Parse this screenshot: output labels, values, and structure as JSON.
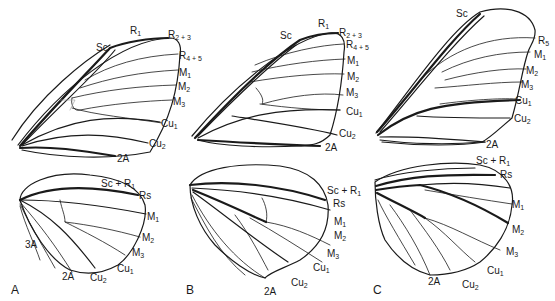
{
  "figure": {
    "panels": [
      {
        "id": "A",
        "letter": "A",
        "forewing_labels": [
          {
            "base": "Sc",
            "sub": ""
          },
          {
            "base": "R",
            "sub": "1"
          },
          {
            "base": "R",
            "sub": "2 + 3"
          },
          {
            "base": "R",
            "sub": "4 + 5"
          },
          {
            "base": "M",
            "sub": "1"
          },
          {
            "base": "M",
            "sub": "2"
          },
          {
            "base": "M",
            "sub": "3"
          },
          {
            "base": "Cu",
            "sub": "1"
          },
          {
            "base": "Cu",
            "sub": "2"
          },
          {
            "base": "2A",
            "sub": ""
          }
        ],
        "hindwing_labels": [
          {
            "base": "Sc + R",
            "sub": "1"
          },
          {
            "base": "Rs",
            "sub": ""
          },
          {
            "base": "M",
            "sub": "1"
          },
          {
            "base": "M",
            "sub": "2"
          },
          {
            "base": "M",
            "sub": "3"
          },
          {
            "base": "Cu",
            "sub": "1"
          },
          {
            "base": "Cu",
            "sub": "2"
          },
          {
            "base": "2A",
            "sub": ""
          },
          {
            "base": "3A",
            "sub": ""
          }
        ]
      },
      {
        "id": "B",
        "letter": "B",
        "forewing_labels": [
          {
            "base": "Sc",
            "sub": ""
          },
          {
            "base": "R",
            "sub": "1"
          },
          {
            "base": "R",
            "sub": "2 + 3"
          },
          {
            "base": "R",
            "sub": "4 + 5"
          },
          {
            "base": "M",
            "sub": "1"
          },
          {
            "base": "M",
            "sub": "2"
          },
          {
            "base": "M",
            "sub": "3"
          },
          {
            "base": "Cu",
            "sub": "1"
          },
          {
            "base": "Cu",
            "sub": "2"
          },
          {
            "base": "2A",
            "sub": ""
          }
        ],
        "hindwing_labels": [
          {
            "base": "Sc + R",
            "sub": "1"
          },
          {
            "base": "Rs",
            "sub": ""
          },
          {
            "base": "M",
            "sub": "1"
          },
          {
            "base": "M",
            "sub": "2"
          },
          {
            "base": "M",
            "sub": "3"
          },
          {
            "base": "Cu",
            "sub": "1"
          },
          {
            "base": "Cu",
            "sub": "2"
          },
          {
            "base": "2A",
            "sub": ""
          }
        ]
      },
      {
        "id": "C",
        "letter": "C",
        "forewing_labels": [
          {
            "base": "Sc",
            "sub": ""
          },
          {
            "base": "R",
            "sub": "5"
          },
          {
            "base": "M",
            "sub": "1"
          },
          {
            "base": "M",
            "sub": "2"
          },
          {
            "base": "M",
            "sub": "3"
          },
          {
            "base": "Cu",
            "sub": "1"
          },
          {
            "base": "Cu",
            "sub": "2"
          },
          {
            "base": "2A",
            "sub": ""
          }
        ],
        "hindwing_labels": [
          {
            "base": "Sc + R",
            "sub": "1"
          },
          {
            "base": "Rs",
            "sub": ""
          },
          {
            "base": "M",
            "sub": "1"
          },
          {
            "base": "M",
            "sub": "2"
          },
          {
            "base": "M",
            "sub": "3"
          },
          {
            "base": "Cu",
            "sub": "1"
          },
          {
            "base": "Cu",
            "sub": "2"
          },
          {
            "base": "2A",
            "sub": ""
          }
        ]
      }
    ]
  }
}
